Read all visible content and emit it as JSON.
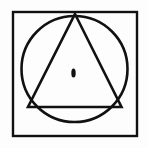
{
  "figure": {
    "canvas": {
      "width": 148,
      "height": 148,
      "background_color": "#fdfdfd"
    },
    "stroke_color": "#111111",
    "fill_color": "#111111",
    "shapes": {
      "square": {
        "name": "square",
        "x": 13,
        "y": 12,
        "width": 124,
        "height": 124,
        "stroke_width": 2.4
      },
      "circle": {
        "name": "circle",
        "cx": 74.5,
        "cy": 69,
        "r": 53,
        "stroke_width": 2.6
      },
      "triangle": {
        "name": "triangle",
        "points": "75,14 121.5,107 28,107",
        "apex_x": 75,
        "apex_y": 14,
        "base_left_x": 28,
        "base_left_y": 107,
        "base_right_x": 121.5,
        "base_right_y": 107,
        "stroke_width": 2.6
      },
      "center_dot": {
        "name": "center-dot",
        "cx": 73.5,
        "cy": 73,
        "rx": 2.2,
        "ry": 4.6
      }
    }
  }
}
